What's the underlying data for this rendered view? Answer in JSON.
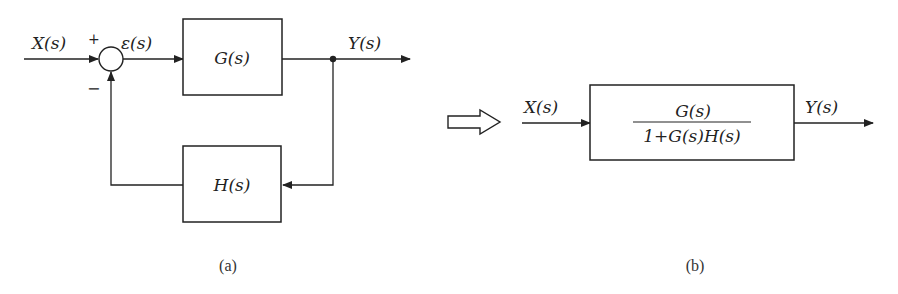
{
  "diagram": {
    "type": "block-diagram",
    "colors": {
      "stroke": "#222222",
      "background": "#ffffff"
    },
    "panel_a": {
      "caption": "(a)",
      "input_label": "X(s)",
      "error_label": "ε(s)",
      "output_label": "Y(s)",
      "plus_sign": "+",
      "minus_sign": "−",
      "forward_block": {
        "label": "G(s)"
      },
      "feedback_block": {
        "label": "H(s)"
      },
      "summing_junction": {
        "inputs": [
          "+",
          "−"
        ]
      }
    },
    "transform_arrow": "hollow-right-arrow",
    "panel_b": {
      "caption": "(b)",
      "input_label": "X(s)",
      "output_label": "Y(s)",
      "block": {
        "numerator": "G(s)",
        "denominator": "1+G(s)H(s)"
      }
    }
  }
}
